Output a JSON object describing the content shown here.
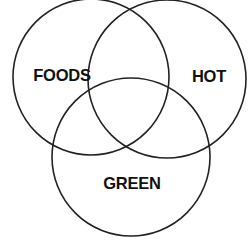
{
  "diagram": {
    "type": "venn",
    "set_count": 3,
    "colors": {
      "background": "#ffffff",
      "stroke": "#222222",
      "text": "#111111"
    },
    "sets": [
      {
        "id": "foods",
        "label": "FOODS",
        "cx": 91,
        "cy": 77,
        "r": 78,
        "label_x": 62,
        "label_y": 75
      },
      {
        "id": "hot",
        "label": "HOT",
        "cx": 167,
        "cy": 79,
        "r": 79,
        "label_x": 209,
        "label_y": 76
      },
      {
        "id": "green",
        "label": "GREEN",
        "cx": 131,
        "cy": 157,
        "r": 79,
        "label_x": 132,
        "label_y": 183
      }
    ]
  }
}
